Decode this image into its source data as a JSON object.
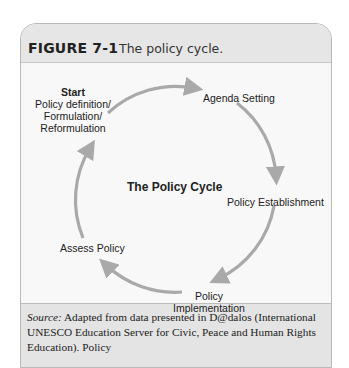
{
  "figure": {
    "label": "FIGURE 7-1",
    "caption": "The policy cycle."
  },
  "diagram": {
    "title": "The Policy Cycle",
    "stages": [
      {
        "id": "start",
        "heading": "Start",
        "lines": [
          "Policy definition/",
          "Formulation/",
          "Reformulation"
        ]
      },
      {
        "id": "agenda",
        "lines": [
          "Agenda Setting"
        ]
      },
      {
        "id": "establishment",
        "lines": [
          "Policy Establishment"
        ]
      },
      {
        "id": "implementation",
        "lines": [
          "Policy",
          "Implementation"
        ]
      },
      {
        "id": "assess",
        "lines": [
          "Assess Policy"
        ]
      }
    ],
    "arrow_color": "#a9a9a9",
    "flow": [
      "start -> agenda",
      "agenda -> establishment",
      "establishment -> implementation",
      "implementation -> assess",
      "assess -> start"
    ]
  },
  "footer": {
    "source_label": "Source:",
    "source_text": " Adapted from data presented in D@dalos (International UNESCO Education Server for Civic, Peace and Human Rights Education). Policy"
  }
}
